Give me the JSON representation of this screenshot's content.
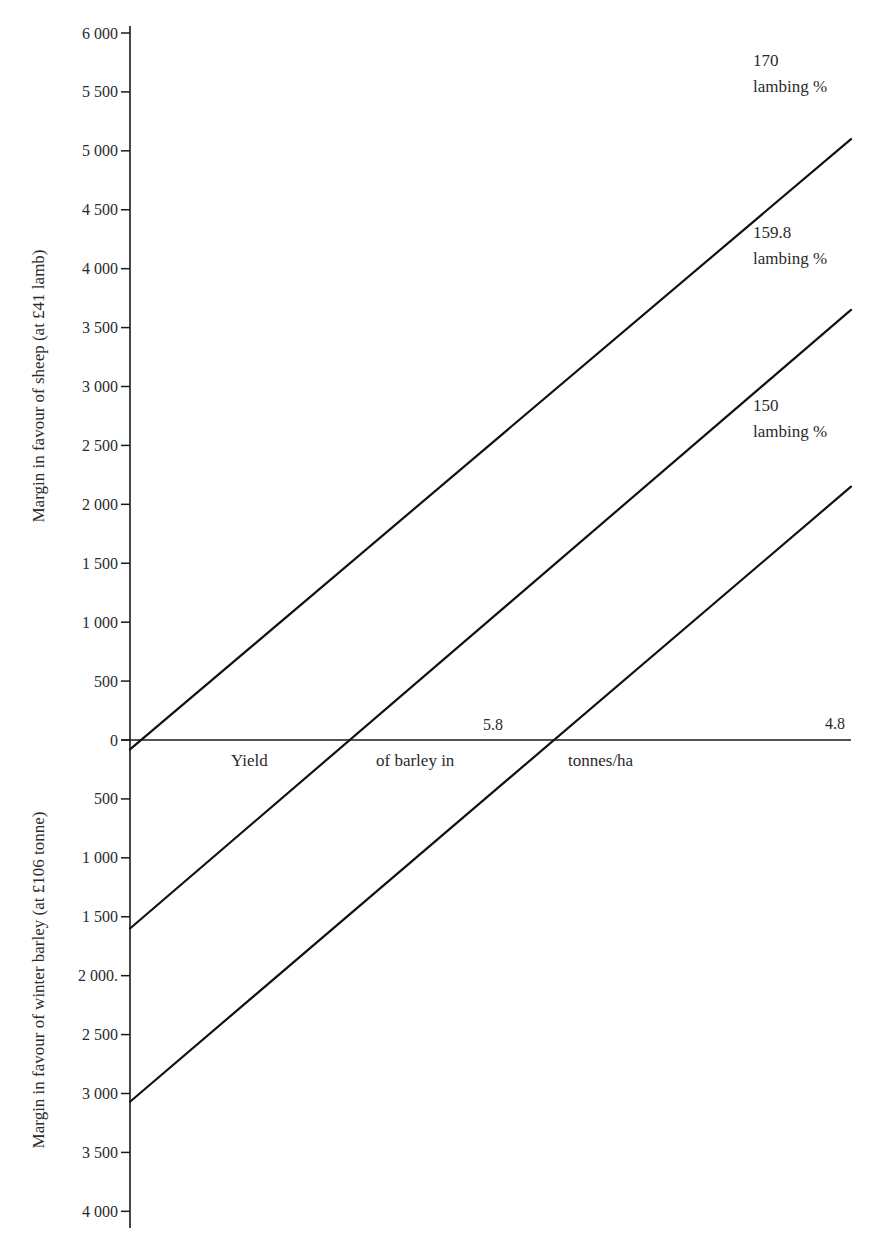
{
  "chart_data": {
    "type": "line",
    "title": "",
    "xlabel": "Yield of barley in tonnes/ha",
    "xlabel_parts": [
      "Yield",
      "of barley in",
      "tonnes/ha"
    ],
    "x_ticks": [
      {
        "label": "5.8",
        "position_fraction": 0.52
      },
      {
        "label": "4.8",
        "position_fraction": 1.0
      }
    ],
    "ylabel_positive": "Margin in favour of sheep (at £41 lamb)",
    "ylabel_negative": "Margin in favour of winter barley (at £106 tonne)",
    "ylim": [
      -4000,
      6000
    ],
    "y_ticks": [
      {
        "value": 6000,
        "label": "6 000"
      },
      {
        "value": 5500,
        "label": "5 500"
      },
      {
        "value": 5000,
        "label": "5 000"
      },
      {
        "value": 4500,
        "label": "4 500"
      },
      {
        "value": 4000,
        "label": "4 000"
      },
      {
        "value": 3500,
        "label": "3 500"
      },
      {
        "value": 3000,
        "label": "3 000"
      },
      {
        "value": 2500,
        "label": "2 500"
      },
      {
        "value": 2000,
        "label": "2 000"
      },
      {
        "value": 1500,
        "label": "1 500"
      },
      {
        "value": 1000,
        "label": "1 000"
      },
      {
        "value": 500,
        "label": "500"
      },
      {
        "value": 0,
        "label": "0"
      },
      {
        "value": -500,
        "label": "500"
      },
      {
        "value": -1000,
        "label": "1 000"
      },
      {
        "value": -1500,
        "label": "1 500"
      },
      {
        "value": -2000,
        "label": "2 000."
      },
      {
        "value": -2500,
        "label": "2 500"
      },
      {
        "value": -3000,
        "label": "3 000"
      },
      {
        "value": -3500,
        "label": "3 500"
      },
      {
        "value": -4000,
        "label": "4 000"
      }
    ],
    "x_range_fraction": [
      0,
      1
    ],
    "series": [
      {
        "name": "170 lambing %",
        "label_line1": "170",
        "label_line2": "lambing %",
        "x": [
          0.0,
          1.0
        ],
        "values": [
          -80,
          5100
        ]
      },
      {
        "name": "159.8 lambing %",
        "label_line1": "159.8",
        "label_line2": "lambing %",
        "x": [
          0.0,
          1.0
        ],
        "values": [
          -1600,
          3650
        ]
      },
      {
        "name": "150 lambing %",
        "label_line1": "150",
        "label_line2": "lambing %",
        "x": [
          0.0,
          1.0
        ],
        "values": [
          -3070,
          2150
        ]
      }
    ],
    "zero_crossings_fraction": {
      "170 lambing %": 0.015,
      "159.8 lambing %": 0.305,
      "150 lambing %": 0.59
    },
    "grid": false,
    "legend": "inline labels at right end of lines",
    "line_color": "#111111"
  }
}
